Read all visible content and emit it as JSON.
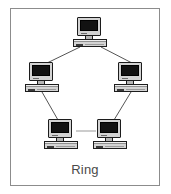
{
  "diagram": {
    "caption": "Ring",
    "topology_type": "ring",
    "node_count": 5,
    "link_count": 5,
    "colors": {
      "background": "#ffffff",
      "frame_border": "#8c8c8c",
      "link_line": "#555555",
      "monitor_bezel": "#d3d3d3",
      "monitor_screen": "#121212",
      "case_body": "#d3d3d3",
      "outline": "#1c1c1c",
      "caption_text": "#4a4a4a"
    },
    "frame": {
      "x": 10,
      "y": 8,
      "width": 150,
      "height": 178
    },
    "nodes": [
      {
        "id": "node-top",
        "label": "computer-top",
        "icon": "desktop-computer-icon",
        "x": 73,
        "y": 17
      },
      {
        "id": "node-left",
        "label": "computer-left",
        "icon": "desktop-computer-icon",
        "x": 25,
        "y": 62
      },
      {
        "id": "node-right",
        "label": "computer-right",
        "icon": "desktop-computer-icon",
        "x": 114,
        "y": 62
      },
      {
        "id": "node-bottom-left",
        "label": "computer-bottom-left",
        "icon": "desktop-computer-icon",
        "x": 44,
        "y": 119
      },
      {
        "id": "node-bottom-right",
        "label": "computer-bottom-right",
        "icon": "desktop-computer-icon",
        "x": 93,
        "y": 119
      }
    ],
    "links": [
      {
        "id": "link-top-left",
        "from": "node-top",
        "to": "node-left",
        "x1": 80,
        "y1": 47,
        "x2": 47,
        "y2": 62
      },
      {
        "id": "link-top-right",
        "from": "node-top",
        "to": "node-right",
        "x1": 101,
        "y1": 47,
        "x2": 132,
        "y2": 62
      },
      {
        "id": "link-left-bottomleft",
        "from": "node-left",
        "to": "node-bottom-left",
        "x1": 42,
        "y1": 92,
        "x2": 57,
        "y2": 120
      },
      {
        "id": "link-right-bottomright",
        "from": "node-right",
        "to": "node-bottom-right",
        "x1": 131,
        "y1": 92,
        "x2": 114,
        "y2": 120
      },
      {
        "id": "link-bottomleft-bottomright",
        "from": "node-bottom-left",
        "to": "node-bottom-right",
        "x1": 76,
        "y1": 131,
        "x2": 95,
        "y2": 131
      }
    ]
  }
}
